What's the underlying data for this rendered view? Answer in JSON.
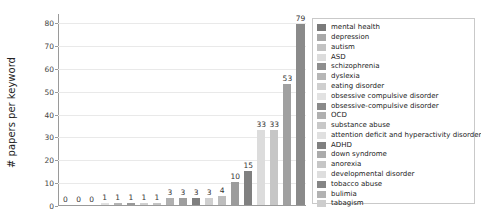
{
  "chart_data": {
    "type": "bar",
    "title": "",
    "xlabel": "",
    "ylabel": "# papers per keyword",
    "ylim": [
      0,
      84
    ],
    "yticks": [
      0,
      10,
      20,
      30,
      40,
      50,
      60,
      70,
      80
    ],
    "grid": true,
    "legend_position": "right",
    "categories": [
      "mental health",
      "depression",
      "autism",
      "ASD",
      "schizophrenia",
      "dyslexia",
      "eating disorder",
      "obsessive compulsive disorder",
      "obsessive-compulsive disorder",
      "OCD",
      "substance abuse",
      "attention deficit and hyperactivity disorder",
      "ADHD",
      "down syndrome",
      "anorexia",
      "developmental disorder",
      "tobacco abuse",
      "bulimia",
      "tabagism"
    ],
    "values": [
      79,
      53,
      33,
      33,
      15,
      10,
      4,
      3,
      3,
      3,
      3,
      1,
      1,
      1,
      1,
      1,
      0,
      0,
      0
    ],
    "bar_order_values": [
      0,
      0,
      0,
      1,
      1,
      1,
      1,
      1,
      3,
      3,
      3,
      3,
      4,
      10,
      15,
      33,
      33,
      53,
      79
    ],
    "bar_colors": [
      "#bfbfbf",
      "#d8d8d8",
      "#c9c9c9",
      "#e0e0e0",
      "#b4b4b4",
      "#9a9a9a",
      "#d0d0d0",
      "#c4c4c4",
      "#b0b0b0",
      "#9e9e9e",
      "#7f7f7f",
      "#cfcfcf",
      "#bdbdbd",
      "#9c9c9c",
      "#808080",
      "#dcdcdc",
      "#c6c6c6",
      "#a0a0a0",
      "#8a8a8a"
    ],
    "bar_labels": [
      "0",
      "0",
      "0",
      "1",
      "1",
      "1",
      "1",
      "1",
      "3",
      "3",
      "3",
      "3",
      "4",
      "10",
      "15",
      "33",
      "33",
      "53",
      "79"
    ]
  },
  "legend": {
    "items": [
      {
        "label": "mental health",
        "color": "#7a7a7a"
      },
      {
        "label": "depression",
        "color": "#a8a8a8"
      },
      {
        "label": "autism",
        "color": "#c2c2c2"
      },
      {
        "label": "ASD",
        "color": "#dcdcdc"
      },
      {
        "label": "schizophrenia",
        "color": "#8e8e8e"
      },
      {
        "label": "dyslexia",
        "color": "#b6b6b6"
      },
      {
        "label": "eating disorder",
        "color": "#cfcfcf"
      },
      {
        "label": "obsessive compulsive disorder",
        "color": "#e2e2e2"
      },
      {
        "label": "obsessive-compulsive disorder",
        "color": "#8a8a8a"
      },
      {
        "label": "OCD",
        "color": "#b0b0b0"
      },
      {
        "label": "substance abuse",
        "color": "#c8c8c8"
      },
      {
        "label": "attention deficit and hyperactivity disorder",
        "color": "#e0e0e0"
      },
      {
        "label": "ADHD",
        "color": "#808080"
      },
      {
        "label": "down syndrome",
        "color": "#ababab"
      },
      {
        "label": "anorexia",
        "color": "#c6c6c6"
      },
      {
        "label": "developmental disorder",
        "color": "#dedede"
      },
      {
        "label": "tobacco abuse",
        "color": "#858585"
      },
      {
        "label": "bulimia",
        "color": "#b2b2b2"
      },
      {
        "label": "tabagism",
        "color": "#cdcdcd"
      }
    ]
  },
  "colors": {
    "axis": "#9a9a9a",
    "grid": "#e9e9e9",
    "text": "#222222",
    "background": "#ffffff"
  }
}
